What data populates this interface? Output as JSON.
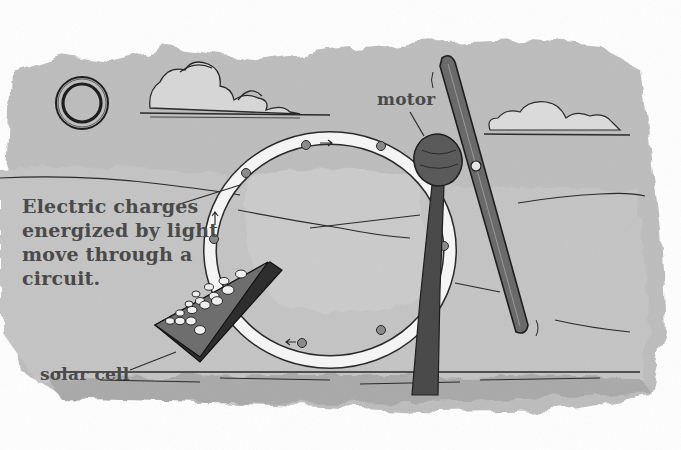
{
  "illustration": {
    "subject": "Solar cell powering a motor-driven propeller through a circuit loop",
    "caption": "Electric charges energized by light move through a circuit.",
    "caption_lines": [
      "Electric charges",
      "energized by light",
      "move through a",
      "circuit."
    ],
    "labels": {
      "motor": "motor",
      "solar_cell": "solar cell"
    },
    "elements": [
      {
        "name": "sun",
        "icon": "sun-icon"
      },
      {
        "name": "cloud-left",
        "icon": "cloud-icon"
      },
      {
        "name": "cloud-right",
        "icon": "cloud-icon"
      },
      {
        "name": "circuit-loop",
        "charges_count": 8,
        "arrows_count": 3
      },
      {
        "name": "solar-cell",
        "cells_count": 16
      },
      {
        "name": "motor"
      },
      {
        "name": "propeller"
      },
      {
        "name": "post"
      },
      {
        "name": "grass-ground"
      }
    ],
    "colors": {
      "wash": "#b9b9b9",
      "wash_light": "#d2d2d2",
      "ink": "#2a2a2a",
      "label_text": "#4a4a4a",
      "background": "#ffffff"
    }
  }
}
